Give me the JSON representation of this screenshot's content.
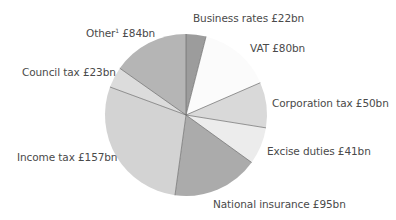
{
  "chart_data": {
    "type": "pie",
    "title": "",
    "unit": "£bn",
    "start_angle_deg": 0,
    "direction": "clockwise",
    "categories": [
      "Business rates",
      "VAT",
      "Corporation tax",
      "Excise duties",
      "National insurance",
      "Income tax",
      "Council tax",
      "Other"
    ],
    "values": [
      22,
      80,
      50,
      41,
      95,
      157,
      23,
      84
    ],
    "colors": [
      "#9c9c9c",
      "#fbfbfb",
      "#d9d9d9",
      "#ececec",
      "#ababab",
      "#d3d3d3",
      "#dcdcdc",
      "#b5b5b5"
    ],
    "legend": "none",
    "footnote_marker": {
      "category": "Other",
      "marker": "1"
    }
  },
  "labels": {
    "business_rates": "Business rates £22bn",
    "vat": "VAT £80bn",
    "corporation_tax": "Corporation tax £50bn",
    "excise_duties": "Excise duties £41bn",
    "national_insurance": "National insurance £95bn",
    "income_tax": "Income tax £157bn",
    "council_tax": "Council tax £23bn",
    "other_name": "Other",
    "other_sup": "1",
    "other_value": " £84bn"
  }
}
